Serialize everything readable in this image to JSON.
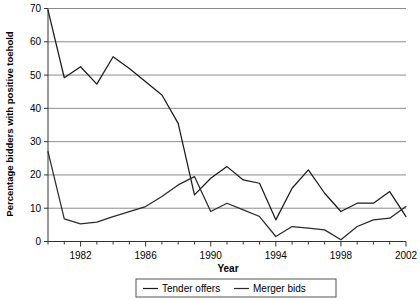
{
  "chart_data": {
    "type": "line",
    "title": "",
    "xlabel": "Year",
    "ylabel": "Percentage bidders with positive toehold",
    "xlim": [
      1980,
      2002
    ],
    "ylim": [
      0,
      70
    ],
    "ytick_values": [
      0,
      10,
      20,
      30,
      40,
      50,
      60,
      70
    ],
    "ytick_labels": [
      "0",
      "10",
      "20",
      "30",
      "40",
      "50",
      "60",
      "70"
    ],
    "xtick_values": [
      1982,
      1986,
      1990,
      1994,
      1998,
      2002
    ],
    "xtick_labels": [
      "1982",
      "1986",
      "1990",
      "1994",
      "1998",
      "2002"
    ],
    "xtick_minor_values": [
      1980,
      1981,
      1983,
      1984,
      1985,
      1987,
      1988,
      1989,
      1991,
      1992,
      1993,
      1995,
      1996,
      1997,
      1999,
      2000,
      2001
    ],
    "grid": "horizontal",
    "legend_position": "bottom-center",
    "x": [
      1980,
      1981,
      1982,
      1983,
      1984,
      1985,
      1986,
      1987,
      1988,
      1989,
      1990,
      1991,
      1992,
      1993,
      1994,
      1995,
      1996,
      1997,
      1998,
      1999,
      2000,
      2001,
      2002
    ],
    "series": [
      {
        "name": "Tender offers",
        "color": "#1a1a1a",
        "values": [
          69.5,
          49.2,
          52.5,
          47.3,
          55.5,
          52.0,
          48.0,
          44.0,
          35.5,
          14.0,
          19.0,
          22.5,
          18.5,
          17.5,
          6.5,
          16.0,
          21.5,
          14.5,
          9.0,
          11.5,
          11.5,
          15.0,
          7.5
        ]
      },
      {
        "name": "Merger bids",
        "color": "#2a2a2a",
        "values": [
          27.0,
          6.8,
          5.3,
          5.8,
          7.5,
          9.0,
          10.5,
          13.5,
          17.0,
          19.5,
          9.0,
          11.5,
          9.5,
          7.5,
          1.5,
          4.5,
          4.0,
          3.5,
          0.5,
          4.5,
          6.5,
          7.0,
          10.5
        ]
      }
    ]
  },
  "legend": {
    "items": [
      {
        "label": "Tender offers"
      },
      {
        "label": "Merger bids"
      }
    ]
  },
  "axis": {
    "x_title": "Year",
    "y_title": "Percentage bidders with positive toehold"
  },
  "colors": {
    "gridline": "#8c8c8c",
    "axis": "#333333",
    "series_1": "#1a1a1a",
    "series_2": "#2a2a2a",
    "legend_border": "#555555",
    "background": "#ffffff"
  }
}
